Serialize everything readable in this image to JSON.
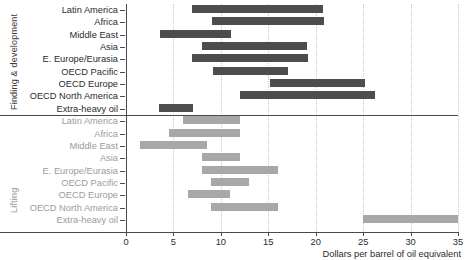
{
  "chart_data": {
    "type": "bar",
    "orientation": "horizontal",
    "subtype": "range-bar",
    "title": "",
    "xlabel": "Dollars per barrel of oil equivalent",
    "ylabel": "",
    "xlim": [
      0,
      35
    ],
    "xticks": [
      0,
      5,
      10,
      15,
      20,
      25,
      30,
      35
    ],
    "xtick_labels": [
      "0",
      "5",
      "10",
      "15",
      "20",
      "25",
      "30",
      "35"
    ],
    "grid": "vertical-dotted",
    "legend": "none",
    "groups": [
      {
        "name": "Finding & development",
        "color": "#4d4d4d",
        "categories": [
          "Latin America",
          "Africa",
          "Middle East",
          "Asia",
          "E. Europe/Eurasia",
          "OECD Pacific",
          "OECD Europe",
          "OECD North America",
          "Extra-heavy oil"
        ],
        "ranges": [
          [
            7.0,
            20.8
          ],
          [
            9.1,
            20.9
          ],
          [
            3.6,
            11.1
          ],
          [
            8.0,
            19.1
          ],
          [
            7.0,
            19.2
          ],
          [
            9.2,
            17.1
          ],
          [
            15.2,
            25.2
          ],
          [
            12.0,
            26.2
          ],
          [
            3.5,
            7.1
          ]
        ]
      },
      {
        "name": "Lifting",
        "color": "#a8a8a8",
        "categories": [
          "Latin America",
          "Africa",
          "Middle East",
          "Asia",
          "E. Europe/Eurasia",
          "OECD Pacific",
          "OECD Europe",
          "OECD North America",
          "Extra-heavy oil"
        ],
        "ranges": [
          [
            6.0,
            12.0
          ],
          [
            4.5,
            12.0
          ],
          [
            1.5,
            8.5
          ],
          [
            8.0,
            12.0
          ],
          [
            8.0,
            16.0
          ],
          [
            9.0,
            13.0
          ],
          [
            6.5,
            11.0
          ],
          [
            9.0,
            16.0
          ],
          [
            25.0,
            35.0
          ]
        ]
      }
    ]
  },
  "axis": {
    "x_title": "Dollars per barrel of oil equivalent"
  }
}
